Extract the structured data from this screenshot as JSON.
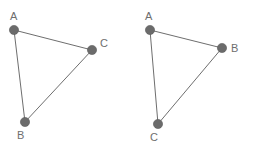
{
  "figure": {
    "background_color": "#ffffff",
    "stroke_color": "#6e6e6e",
    "dot_fill_color": "#6b6b6b",
    "dot_stroke_color": "#5a5a5a",
    "label_color": "#6e6e6e",
    "dot_radius": 4.6,
    "edge_width": 1,
    "label_font_size": 11,
    "shapes": [
      {
        "id": "left-triangle",
        "name": "triangle-left",
        "vertices": [
          {
            "label": "A",
            "x": 14,
            "y": 30,
            "label_x": 10,
            "label_y": 20
          },
          {
            "label": "B",
            "x": 25,
            "y": 122,
            "label_x": 17,
            "label_y": 139
          },
          {
            "label": "C",
            "x": 92,
            "y": 50,
            "label_x": 100,
            "label_y": 47
          }
        ],
        "edges": [
          {
            "from": "A",
            "to": "C"
          },
          {
            "from": "A",
            "to": "B"
          },
          {
            "from": "B",
            "to": "C"
          }
        ]
      },
      {
        "id": "right-triangle",
        "name": "triangle-right",
        "vertices": [
          {
            "label": "A",
            "x": 150,
            "y": 30,
            "label_x": 145,
            "label_y": 20
          },
          {
            "label": "B",
            "x": 222,
            "y": 48,
            "label_x": 231,
            "label_y": 46
          },
          {
            "label": "C",
            "x": 158,
            "y": 124,
            "label_x": 150,
            "label_y": 141
          }
        ],
        "edges": [
          {
            "from": "A",
            "to": "B"
          },
          {
            "from": "A",
            "to": "C"
          },
          {
            "from": "C",
            "to": "B"
          }
        ]
      }
    ]
  }
}
